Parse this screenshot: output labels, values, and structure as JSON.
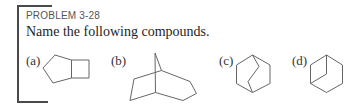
{
  "problem": {
    "number": "PROBLEM 3-28",
    "prompt": "Name the following compounds."
  },
  "compounds": [
    {
      "label": "(a)",
      "structure": "bicyclo[3.2.0]heptane skeleton (cyclopentane fused to cyclobutane)"
    },
    {
      "label": "(b)",
      "structure": "bicyclo[3.2.1]octane-type bridged skeleton"
    },
    {
      "label": "(c)",
      "structure": "bicyclo[2.2.2]octane skeleton (hexagon with two-carbon bridge)"
    },
    {
      "label": "(d)",
      "structure": "bicyclo[3.1.0]hexane-type skeleton (hexagon with one-carbon bridge)"
    }
  ],
  "colors": {
    "text": "#2a2a2a",
    "bracket": "#4a4a4a",
    "bonds": "#666666"
  }
}
